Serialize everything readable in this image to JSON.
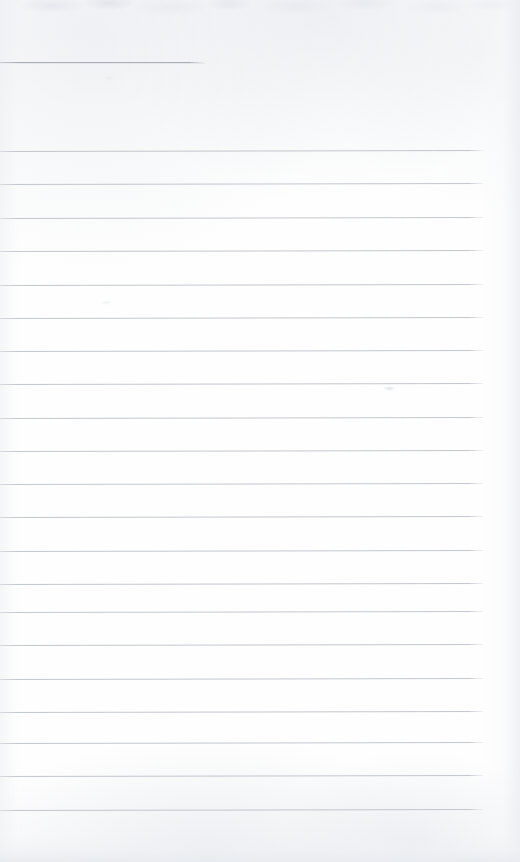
{
  "page": {
    "kind": "blank-ruled-notebook-page-scan",
    "width": 520,
    "height": 862,
    "background_color": "#fdfdfd",
    "text_content": "",
    "handwriting_present": "none",
    "printed_text_present": "none"
  },
  "ruling": {
    "line_color": "#b9bdc5",
    "header_rule_color": "#a7abb4",
    "line_thickness_px": 1,
    "line_spacing_px": 33,
    "left_edge_px": 0,
    "right_edge_px": 483,
    "total_full_width_lines": 21,
    "header_rule": {
      "y": 62,
      "x_start": 0,
      "x_end": 205,
      "label": "short-top-rule"
    },
    "lines": [
      {
        "y": 151,
        "x_start": 0,
        "x_end": 484,
        "slope_deg": -0.12
      },
      {
        "y": 184,
        "x_start": 0,
        "x_end": 484,
        "slope_deg": -0.12
      },
      {
        "y": 218,
        "x_start": 0,
        "x_end": 484,
        "slope_deg": -0.12
      },
      {
        "y": 251,
        "x_start": 0,
        "x_end": 484,
        "slope_deg": -0.12
      },
      {
        "y": 285,
        "x_start": 0,
        "x_end": 484,
        "slope_deg": -0.12
      },
      {
        "y": 318,
        "x_start": 0,
        "x_end": 484,
        "slope_deg": -0.12
      },
      {
        "y": 351,
        "x_start": 0,
        "x_end": 484,
        "slope_deg": -0.12
      },
      {
        "y": 384,
        "x_start": 0,
        "x_end": 484,
        "slope_deg": -0.12
      },
      {
        "y": 418,
        "x_start": 0,
        "x_end": 484,
        "slope_deg": -0.12
      },
      {
        "y": 451,
        "x_start": 0,
        "x_end": 484,
        "slope_deg": -0.12
      },
      {
        "y": 484,
        "x_start": 0,
        "x_end": 484,
        "slope_deg": -0.12
      },
      {
        "y": 517,
        "x_start": 0,
        "x_end": 484,
        "slope_deg": -0.12
      },
      {
        "y": 551,
        "x_start": 0,
        "x_end": 484,
        "slope_deg": -0.12
      },
      {
        "y": 584,
        "x_start": 0,
        "x_end": 484,
        "slope_deg": -0.12
      },
      {
        "y": 612,
        "x_start": 0,
        "x_end": 484,
        "slope_deg": -0.12
      },
      {
        "y": 645,
        "x_start": 0,
        "x_end": 484,
        "slope_deg": -0.12
      },
      {
        "y": 679,
        "x_start": 0,
        "x_end": 484,
        "slope_deg": -0.12
      },
      {
        "y": 712,
        "x_start": 0,
        "x_end": 484,
        "slope_deg": -0.12
      },
      {
        "y": 743,
        "x_start": 0,
        "x_end": 484,
        "slope_deg": -0.12
      },
      {
        "y": 776,
        "x_start": 0,
        "x_end": 484,
        "slope_deg": -0.12
      },
      {
        "y": 810,
        "x_start": 0,
        "x_end": 484,
        "slope_deg": -0.12
      }
    ]
  },
  "margins": {
    "right_blank_strip_start_px": 484,
    "right_blank_strip_width_px": 36,
    "top_blank_height_px": 151,
    "bottom_blank_height_px": 52
  },
  "artifacts": {
    "top_edge_grain_height_px": 18,
    "bottom_shadow_band_height_px": 26,
    "smudges": [
      {
        "name": "smudge-mid-right",
        "x": 383,
        "y": 386,
        "w": 13,
        "h": 5
      },
      {
        "name": "smudge-upper-left",
        "x": 104,
        "y": 76,
        "w": 10,
        "h": 4
      },
      {
        "name": "smudge-mid-left",
        "x": 100,
        "y": 300,
        "w": 12,
        "h": 5
      }
    ]
  }
}
